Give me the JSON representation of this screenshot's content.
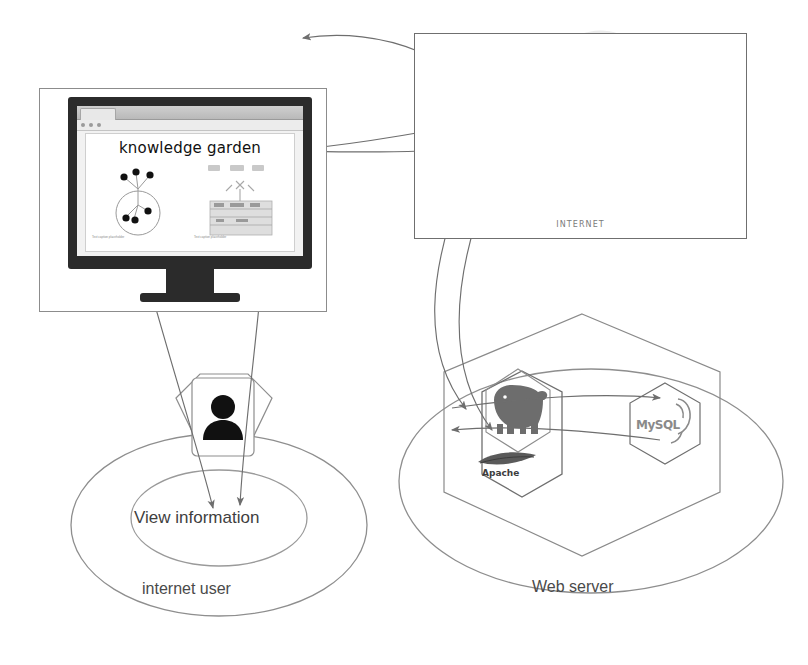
{
  "diagram": {
    "background_color": "#ffffff",
    "stroke_color": "#7a7a7a"
  },
  "monitor": {
    "name": "client-computer-monitor",
    "browser": {
      "page_title": "knowledge garden",
      "left_caption": "Text caption placeholder",
      "right_caption": "Text caption placeholder"
    }
  },
  "internet": {
    "label": "INTERNET",
    "icon": "network-cloud-icon"
  },
  "user_group": {
    "outer_label": "internet user",
    "inner_label": "View information",
    "avatar_icon": "person-icon"
  },
  "server_group": {
    "outer_label": "Web server",
    "nodes": [
      {
        "name": "php",
        "icon": "php-elephant-icon",
        "label": ""
      },
      {
        "name": "apache",
        "icon": "apache-feather-icon",
        "label": "Apache"
      },
      {
        "name": "mysql",
        "icon": "mysql-dolphin-icon",
        "label": "MySQL"
      }
    ]
  },
  "connections": [
    {
      "from": "monitor",
      "to": "internet",
      "direction": "both"
    },
    {
      "from": "internet",
      "to": "web-server",
      "direction": "both"
    },
    {
      "from": "monitor",
      "to": "view-information",
      "direction": "both"
    },
    {
      "from": "php",
      "to": "mysql",
      "direction": "both"
    }
  ]
}
